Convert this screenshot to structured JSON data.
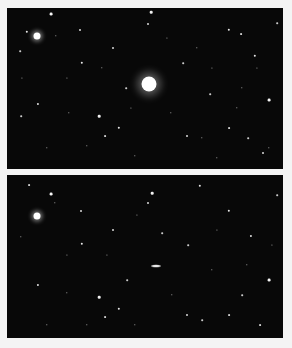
{
  "figure": {
    "colors": {
      "sky": "#080808",
      "star": "#ffffff",
      "frame": "#f4f4f4"
    }
  },
  "panels": [
    {
      "id": "top",
      "bright_objects": [
        {
          "x": 142,
          "y": 76,
          "r": 7.5,
          "kind": "bright-disk"
        },
        {
          "x": 30,
          "y": 28,
          "r": 3.5,
          "kind": "bright-star"
        }
      ],
      "stars": [
        [
          44,
          6,
          1.4
        ],
        [
          144,
          4,
          1.3
        ],
        [
          20,
          24,
          1.2
        ],
        [
          73,
          22,
          1
        ],
        [
          141,
          16,
          1
        ],
        [
          222,
          22,
          1.2
        ],
        [
          234,
          26,
          0.9
        ],
        [
          106,
          40,
          1
        ],
        [
          13,
          43,
          0.8
        ],
        [
          75,
          55,
          1.2
        ],
        [
          248,
          48,
          1.2
        ],
        [
          176,
          55,
          0.8
        ],
        [
          262,
          92,
          1.4
        ],
        [
          31,
          96,
          1.1
        ],
        [
          92,
          108,
          1.3
        ],
        [
          112,
          120,
          1.2
        ],
        [
          98,
          128,
          0.9
        ],
        [
          222,
          120,
          0.9
        ],
        [
          203,
          86,
          0.8
        ],
        [
          180,
          128,
          1
        ],
        [
          241,
          130,
          0.8
        ],
        [
          256,
          145,
          1
        ],
        [
          49,
          28,
          0.7
        ],
        [
          119,
          80,
          0.8
        ],
        [
          164,
          105,
          0.7
        ],
        [
          62,
          105,
          0.7
        ],
        [
          14,
          108,
          0.8
        ],
        [
          195,
          130,
          0.7
        ],
        [
          230,
          100,
          0.7
        ],
        [
          262,
          140,
          0.7
        ],
        [
          40,
          140,
          0.7
        ],
        [
          128,
          148,
          0.7
        ],
        [
          80,
          138,
          0.7
        ],
        [
          210,
          150,
          0.7
        ],
        [
          235,
          80,
          0.7
        ],
        [
          270,
          15,
          0.8
        ],
        [
          190,
          40,
          0.7
        ],
        [
          60,
          70,
          0.6
        ],
        [
          95,
          60,
          0.7
        ],
        [
          160,
          30,
          0.6
        ],
        [
          250,
          60,
          0.6
        ],
        [
          15,
          70,
          0.6
        ],
        [
          205,
          60,
          0.6
        ],
        [
          124,
          100,
          0.6
        ]
      ]
    },
    {
      "id": "bottom",
      "bright_objects": [
        {
          "x": 30,
          "y": 41,
          "r": 3.5,
          "kind": "bright-star"
        },
        {
          "x": 149,
          "y": 91,
          "w": 10,
          "h": 3,
          "kind": "streak"
        }
      ],
      "stars": [
        [
          44,
          19,
          1.4
        ],
        [
          145,
          18,
          1.3
        ],
        [
          193,
          11,
          1.2
        ],
        [
          22,
          10,
          0.9
        ],
        [
          74,
          36,
          1
        ],
        [
          141,
          28,
          1
        ],
        [
          222,
          36,
          1.2
        ],
        [
          106,
          55,
          1
        ],
        [
          244,
          61,
          1.1
        ],
        [
          75,
          69,
          1.2
        ],
        [
          181,
          70,
          0.8
        ],
        [
          262,
          105,
          1.4
        ],
        [
          31,
          110,
          1.1
        ],
        [
          92,
          122,
          1.3
        ],
        [
          112,
          134,
          1.2
        ],
        [
          98,
          142,
          0.9
        ],
        [
          180,
          140,
          1
        ],
        [
          222,
          140,
          0.9
        ],
        [
          253,
          150,
          0.9
        ],
        [
          235,
          120,
          0.8
        ],
        [
          155,
          58,
          0.8
        ],
        [
          120,
          105,
          0.8
        ],
        [
          165,
          120,
          0.7
        ],
        [
          60,
          118,
          0.7
        ],
        [
          14,
          62,
          0.7
        ],
        [
          48,
          28,
          0.7
        ],
        [
          270,
          20,
          0.8
        ],
        [
          205,
          95,
          0.7
        ],
        [
          240,
          90,
          0.7
        ],
        [
          128,
          150,
          0.7
        ],
        [
          80,
          150,
          0.7
        ],
        [
          40,
          150,
          0.7
        ],
        [
          195,
          145,
          0.8
        ],
        [
          100,
          80,
          0.6
        ],
        [
          60,
          80,
          0.6
        ],
        [
          210,
          55,
          0.6
        ],
        [
          265,
          70,
          0.6
        ],
        [
          130,
          40,
          0.6
        ]
      ]
    }
  ]
}
